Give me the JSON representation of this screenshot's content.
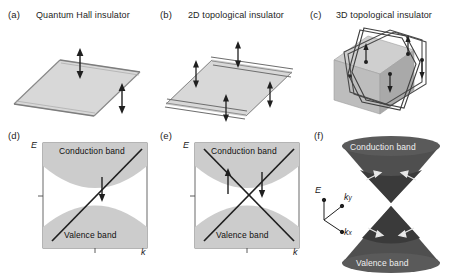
{
  "figure": {
    "background": "#ffffff",
    "ink": "#1a1a1a",
    "slab_fill": "#d7d7d7",
    "band_fill": "#c9c9c9",
    "cone_fill": "#4a4a4a",
    "cube_fill": "#bfbfbf"
  },
  "panels": [
    {
      "id": "a",
      "label": "(a)",
      "title": "Quantum Hall insulator",
      "kind": "slab-2d",
      "edge_lines": 1,
      "arrows": [
        {
          "position": "upper-left-edge",
          "direction": "up"
        },
        {
          "position": "lower-right-edge",
          "direction": "down"
        }
      ]
    },
    {
      "id": "b",
      "label": "(b)",
      "title": "2D topological insulator",
      "kind": "slab-2d",
      "edge_lines": 2,
      "arrows": [
        {
          "position": "upper-edge-left",
          "direction": "up"
        },
        {
          "position": "upper-edge-right",
          "direction": "down"
        },
        {
          "position": "lower-edge-left",
          "direction": "up"
        },
        {
          "position": "lower-edge-right",
          "direction": "down"
        }
      ]
    },
    {
      "id": "c",
      "label": "(c)",
      "title": "3D topological insulator",
      "kind": "cube-3d",
      "loops": 2,
      "arrow_count": 4
    },
    {
      "id": "d",
      "label": "(d)",
      "title": "",
      "kind": "band-diagram",
      "axis_y": "E",
      "axis_x": "k",
      "conduction_label": "Conduction band",
      "valence_label": "Valence band",
      "dispersion": "single-chiral-line",
      "spin_arrows": [
        {
          "branch": "chiral",
          "direction": "down"
        }
      ]
    },
    {
      "id": "e",
      "label": "(e)",
      "title": "",
      "kind": "band-diagram",
      "axis_y": "E",
      "axis_x": "k",
      "conduction_label": "Conduction band",
      "valence_label": "Valence band",
      "dispersion": "dirac-crossing",
      "spin_arrows": [
        {
          "branch": "left",
          "direction": "up"
        },
        {
          "branch": "right",
          "direction": "down"
        }
      ]
    },
    {
      "id": "f",
      "label": "(f)",
      "title": "",
      "kind": "dirac-cone-3d",
      "conduction_label": "Conduction band",
      "valence_label": "Valence band",
      "axes": {
        "vertical": "E",
        "depth": "k",
        "depth_sub": "y",
        "horizontal": "k",
        "horizontal_sub": "x"
      },
      "spin_arrow_count": 4
    }
  ]
}
